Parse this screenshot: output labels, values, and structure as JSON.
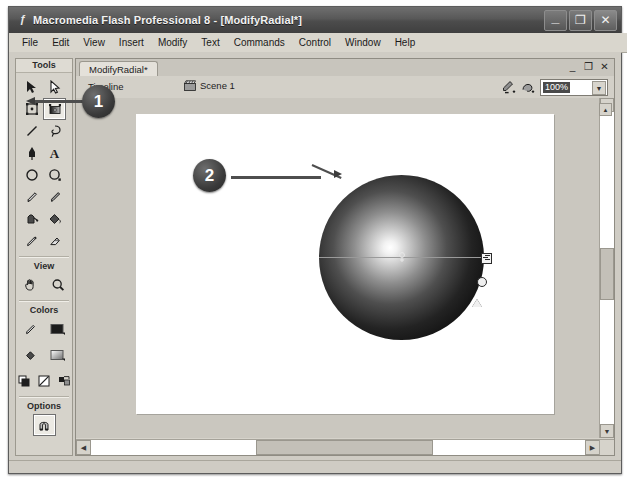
{
  "window": {
    "title": "Macromedia Flash Professional 8 - [ModifyRadial*]",
    "app_icon": "flash-icon",
    "controls": {
      "minimize": "_",
      "restore": "❐",
      "close": "✕"
    }
  },
  "menubar": {
    "items": [
      {
        "label": "File"
      },
      {
        "label": "Edit"
      },
      {
        "label": "View"
      },
      {
        "label": "Insert"
      },
      {
        "label": "Modify"
      },
      {
        "label": "Text"
      },
      {
        "label": "Commands"
      },
      {
        "label": "Control"
      },
      {
        "label": "Window"
      },
      {
        "label": "Help"
      }
    ]
  },
  "tools_panel": {
    "sections": [
      {
        "header": "Tools",
        "tools": [
          {
            "name": "selection-tool",
            "icon": "arrow-icon"
          },
          {
            "name": "subselection-tool",
            "icon": "white-arrow-icon"
          },
          {
            "name": "free-transform-tool",
            "icon": "free-transform-icon"
          },
          {
            "name": "gradient-transform-tool",
            "icon": "gradient-transform-icon",
            "active": true
          },
          {
            "name": "line-tool",
            "icon": "line-icon"
          },
          {
            "name": "lasso-tool",
            "icon": "lasso-icon"
          },
          {
            "name": "pen-tool",
            "icon": "pen-icon"
          },
          {
            "name": "text-tool",
            "icon": "text-a-icon"
          },
          {
            "name": "oval-tool",
            "icon": "oval-icon"
          },
          {
            "name": "rectangle-tool",
            "icon": "rectangle-icon"
          },
          {
            "name": "pencil-tool",
            "icon": "pencil-icon"
          },
          {
            "name": "brush-tool",
            "icon": "brush-icon"
          },
          {
            "name": "ink-bottle-tool",
            "icon": "ink-bottle-icon"
          },
          {
            "name": "paint-bucket-tool",
            "icon": "paint-bucket-icon"
          },
          {
            "name": "eyedropper-tool",
            "icon": "eyedropper-icon"
          },
          {
            "name": "eraser-tool",
            "icon": "eraser-icon"
          }
        ]
      },
      {
        "header": "View",
        "tools": [
          {
            "name": "hand-tool",
            "icon": "hand-icon"
          },
          {
            "name": "zoom-tool",
            "icon": "magnifier-icon"
          }
        ]
      },
      {
        "header": "Colors",
        "tools": [
          {
            "name": "stroke-color",
            "icon": "pencil-icon"
          },
          {
            "name": "stroke-swatch",
            "icon": "color-swatch-icon"
          },
          {
            "name": "fill-color",
            "icon": "paint-bucket-icon"
          },
          {
            "name": "fill-swatch",
            "icon": "color-swatch-icon"
          },
          {
            "name": "black-and-white",
            "icon": "black-white-icon"
          },
          {
            "name": "no-color",
            "icon": "no-color-icon"
          },
          {
            "name": "swap-colors",
            "icon": "swap-colors-icon"
          }
        ]
      },
      {
        "header": "Options",
        "tools": [
          {
            "name": "snap-to-objects",
            "icon": "magnet-icon"
          }
        ]
      }
    ]
  },
  "document_window": {
    "tab_label": "ModifyRadial*",
    "controls": {
      "minimize": "_",
      "restore": "❐",
      "close": "✕"
    },
    "timeline_label": "Timeline",
    "scene": {
      "icon": "scene-clapper-icon",
      "label": "Scene 1"
    },
    "edit_symbol_icon": "edit-symbol-icon",
    "edit_scene_icon": "edit-scene-icon",
    "zoom": {
      "value": "100%",
      "dropdown_icon": "chevron-down-icon"
    }
  },
  "stage": {
    "shape": {
      "name": "radial-gradient-circle",
      "fill_type": "radial gradient",
      "center_color": "#ffffff",
      "edge_color": "#000000"
    },
    "gradient_handles": [
      {
        "name": "gradient-center-handle",
        "icon": "center-point-icon"
      },
      {
        "name": "gradient-width-handle",
        "icon": "square-arrow-icon"
      },
      {
        "name": "gradient-size-handle",
        "icon": "circle-handle-icon"
      },
      {
        "name": "gradient-rotation-handle",
        "icon": "triangle-handle-icon"
      }
    ]
  },
  "callouts": [
    {
      "number": "1",
      "target": "gradient-transform-tool"
    },
    {
      "number": "2",
      "target": "radial-gradient-circle"
    }
  ],
  "scrollbars": {
    "vertical": {
      "up_icon": "▲",
      "down_icon": "▼"
    },
    "horizontal": {
      "left_icon": "◀",
      "right_icon": "▶"
    },
    "collapse_icon": "▲",
    "panel_collapse_icon": "▼"
  }
}
